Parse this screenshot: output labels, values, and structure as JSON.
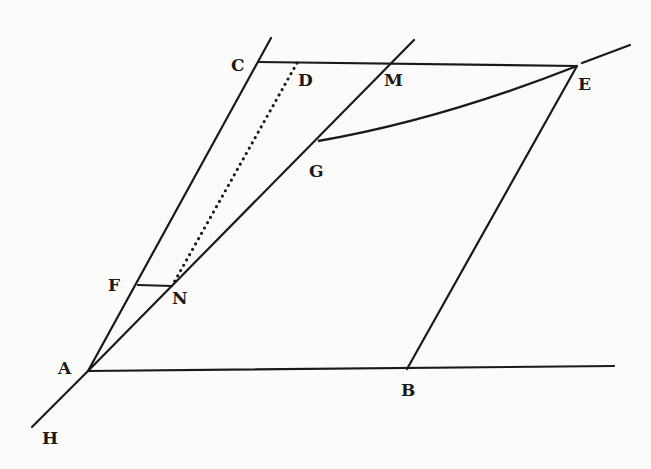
{
  "diagram": {
    "type": "geometric-construction",
    "stroke_color": "#1a1a1a",
    "background": "#fbfbf9",
    "points": [
      {
        "name": "A",
        "label": "A",
        "x": 88,
        "y": 371,
        "label_x": 58,
        "label_y": 360
      },
      {
        "name": "B",
        "label": "B",
        "x": 407,
        "y": 369,
        "label_x": 401,
        "label_y": 382
      },
      {
        "name": "C",
        "label": "C",
        "x": 258,
        "y": 62,
        "label_x": 231,
        "label_y": 57
      },
      {
        "name": "D",
        "label": "D",
        "x": 297,
        "y": 63,
        "label_x": 298,
        "label_y": 72
      },
      {
        "name": "M",
        "label": "M",
        "x": 384,
        "y": 64,
        "label_x": 384,
        "label_y": 72
      },
      {
        "name": "E",
        "label": "E",
        "x": 577,
        "y": 66,
        "label_x": 578,
        "label_y": 76
      },
      {
        "name": "G",
        "label": "G",
        "x": 318,
        "y": 141,
        "label_x": 309,
        "label_y": 163
      },
      {
        "name": "F",
        "label": "F",
        "x": 138,
        "y": 285,
        "label_x": 108,
        "label_y": 277
      },
      {
        "name": "N",
        "label": "N",
        "x": 172,
        "y": 286,
        "label_x": 172,
        "label_y": 290
      },
      {
        "name": "H",
        "label": "H",
        "x": 32,
        "y": 427,
        "label_x": 42,
        "label_y": 430
      }
    ],
    "segments": [
      {
        "name": "line-A-C",
        "from": [
          88,
          371
        ],
        "to": [
          271,
          38
        ],
        "style": "solid"
      },
      {
        "name": "line-A-M-extended",
        "from": [
          88,
          371
        ],
        "to": [
          414,
          40
        ],
        "style": "solid"
      },
      {
        "name": "line-H-A",
        "from": [
          32,
          427
        ],
        "to": [
          88,
          371
        ],
        "style": "solid"
      },
      {
        "name": "line-C-E",
        "from": [
          258,
          62
        ],
        "to": [
          577,
          66
        ],
        "style": "solid"
      },
      {
        "name": "line-E-extended",
        "from": [
          582,
          63
        ],
        "to": [
          630,
          45
        ],
        "style": "solid"
      },
      {
        "name": "line-A-B",
        "from": [
          88,
          371
        ],
        "to": [
          614,
          366
        ],
        "style": "solid"
      },
      {
        "name": "line-B-E",
        "from": [
          407,
          369
        ],
        "to": [
          577,
          66
        ],
        "style": "solid"
      },
      {
        "name": "line-F-N",
        "from": [
          138,
          285
        ],
        "to": [
          172,
          286
        ],
        "style": "solid"
      },
      {
        "name": "line-D-N-dotted",
        "from": [
          297,
          63
        ],
        "to": [
          172,
          286
        ],
        "style": "dotted"
      }
    ],
    "curves": [
      {
        "name": "curve-G-E",
        "from": [
          318,
          141
        ],
        "control": [
          440,
          120
        ],
        "to": [
          577,
          66
        ]
      }
    ]
  }
}
